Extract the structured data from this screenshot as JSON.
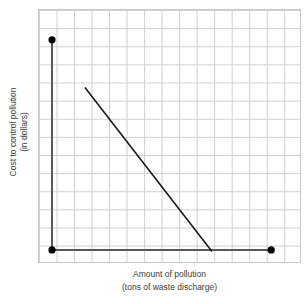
{
  "chart_data": {
    "type": "line",
    "title": "",
    "subtitle": "",
    "xlabel": "Amount of pollution",
    "xlabel_sub": "(tons of waste discharge)",
    "ylabel": "Cost to control pollution",
    "ylabel_sub": "(in dollars)",
    "grid": true,
    "grid_columns": 15,
    "grid_rows": 14,
    "legend": "none",
    "xlim": [
      0,
      15
    ],
    "ylim": [
      0,
      14
    ],
    "xticklabels": [],
    "yticklabels": [],
    "axis_color": "#595959",
    "line_color": "#1a1a1a",
    "grid_color": "#cfcfcf",
    "marker_color": "#000000",
    "series": [
      {
        "name": "Cost to control pollution",
        "trend": "decreasing",
        "x": [
          2.7,
          9.9
        ],
        "y": [
          9.65,
          0.66
        ],
        "points": [
          {
            "x": 2.7,
            "y": 9.65
          },
          {
            "x": 9.9,
            "y": 0.66
          }
        ]
      }
    ],
    "axis_markers": [
      {
        "name": "y-axis-top",
        "x": 0.8,
        "y": 12.3
      },
      {
        "name": "origin",
        "x": 0.8,
        "y": 0.72
      },
      {
        "name": "x-axis-right",
        "x": 13.3,
        "y": 0.72
      }
    ],
    "annotations": []
  },
  "axes": {
    "x_label_line1": "Amount of pollution",
    "x_label_line2": "(tons of waste discharge)",
    "y_label_line1": "Cost to control pollution",
    "y_label_line2": "(in dollars)"
  }
}
